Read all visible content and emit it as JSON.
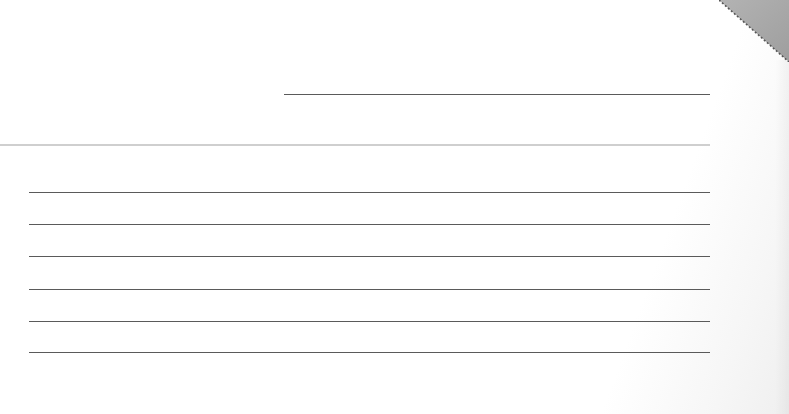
{
  "form": {
    "header_line": {
      "x": 284,
      "y": 94,
      "width": 426
    },
    "divider": {
      "y": 144,
      "color": "#cfcfcf"
    },
    "ruled_lines": [
      {
        "y": 192
      },
      {
        "y": 224
      },
      {
        "y": 256
      },
      {
        "y": 289
      },
      {
        "y": 321
      },
      {
        "y": 352
      }
    ],
    "line_color": "#5a5a5a"
  },
  "corner_fold": {
    "color": "#a9a9a9",
    "edge_style": "dotted"
  }
}
